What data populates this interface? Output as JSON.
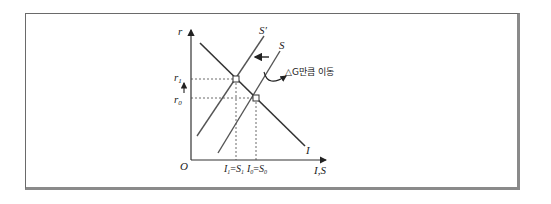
{
  "diagram": {
    "type": "economics-IS-savings-investment",
    "axes": {
      "x_label": "I,S",
      "y_label": "r",
      "origin_label": "O"
    },
    "curves": [
      {
        "name": "I",
        "label": "I",
        "description": "investment curve, downward sloping"
      },
      {
        "name": "S",
        "label": "S",
        "description": "original savings curve"
      },
      {
        "name": "S_prime",
        "label": "S′",
        "description": "shifted savings curve"
      }
    ],
    "y_ticks": {
      "r1": {
        "base": "r",
        "sub": "1"
      },
      "r0": {
        "base": "r",
        "sub": "0"
      }
    },
    "x_ticks": {
      "eq1": {
        "a": "I",
        "a_sub": "1",
        "eq": "=",
        "b": "S",
        "b_sub": "1"
      },
      "eq0": {
        "a": "I",
        "a_sub": "0",
        "eq": "=",
        "b": "S",
        "b_sub": "0"
      }
    },
    "annotation": {
      "text": "△G만큼 이동"
    },
    "colors": {
      "line": "#333333",
      "supply_line": "#555555",
      "frame": "#6a6a6a"
    }
  }
}
